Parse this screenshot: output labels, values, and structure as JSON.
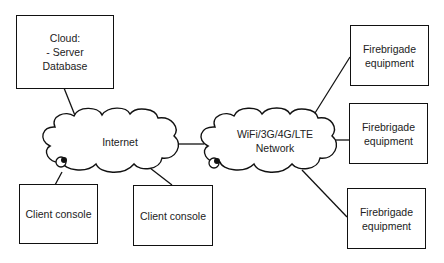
{
  "diagram": {
    "type": "network-architecture",
    "nodes": [
      {
        "id": "server",
        "label_lines": [
          "Cloud:",
          "- Server",
          "Database"
        ],
        "shape": "rectangle"
      },
      {
        "id": "internet",
        "label_lines": [
          "Internet"
        ],
        "shape": "cloud"
      },
      {
        "id": "wireless",
        "label_lines": [
          "WiFi/3G/4G/LTE",
          "Network"
        ],
        "shape": "cloud"
      },
      {
        "id": "client1",
        "label_lines": [
          "Client console"
        ],
        "shape": "rectangle"
      },
      {
        "id": "client2",
        "label_lines": [
          "Client console"
        ],
        "shape": "rectangle"
      },
      {
        "id": "fire1",
        "label_lines": [
          "Firebrigade",
          "equipment"
        ],
        "shape": "rectangle"
      },
      {
        "id": "fire2",
        "label_lines": [
          "Firebrigade",
          "equipment"
        ],
        "shape": "rectangle"
      },
      {
        "id": "fire3",
        "label_lines": [
          "Firebrigade",
          "equipment"
        ],
        "shape": "rectangle"
      }
    ],
    "edges": [
      [
        "server",
        "internet"
      ],
      [
        "internet",
        "client1"
      ],
      [
        "internet",
        "client2"
      ],
      [
        "internet",
        "wireless"
      ],
      [
        "wireless",
        "fire1"
      ],
      [
        "wireless",
        "fire2"
      ],
      [
        "wireless",
        "fire3"
      ]
    ],
    "connector_markers": [
      {
        "on": "internet",
        "icon": "connector-knot-icon"
      },
      {
        "on": "wireless",
        "icon": "connector-knot-icon"
      }
    ],
    "colors": {
      "stroke": "#111111",
      "background": "#ffffff",
      "text": "#222222"
    }
  }
}
